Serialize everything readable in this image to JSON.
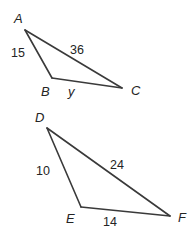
{
  "figure": {
    "stroke_color": "#3a3a3a",
    "text_color": "#242424",
    "background_color": "#ffffff",
    "triangles": [
      {
        "name": "triangle-abc",
        "vertices": [
          {
            "label": "A",
            "x": 25,
            "y": 30
          },
          {
            "label": "B",
            "x": 52,
            "y": 78
          },
          {
            "label": "C",
            "x": 122,
            "y": 88
          }
        ],
        "vertex_labels": [
          {
            "text": "A",
            "x": 14,
            "y": 12
          },
          {
            "text": "B",
            "x": 41,
            "y": 85
          },
          {
            "text": "C",
            "x": 131,
            "y": 84
          }
        ],
        "side_labels": [
          {
            "text": "15",
            "side": "AB",
            "x": 11,
            "y": 47
          },
          {
            "text": "36",
            "side": "AC",
            "x": 70,
            "y": 44
          },
          {
            "text": "y",
            "side": "BC",
            "x": 68,
            "y": 85
          }
        ]
      },
      {
        "name": "triangle-def",
        "vertices": [
          {
            "label": "D",
            "x": 47,
            "y": 128
          },
          {
            "label": "E",
            "x": 81,
            "y": 207
          },
          {
            "label": "F",
            "x": 170,
            "y": 216
          }
        ],
        "vertex_labels": [
          {
            "text": "D",
            "x": 35,
            "y": 111
          },
          {
            "text": "E",
            "x": 66,
            "y": 212
          },
          {
            "text": "F",
            "x": 178,
            "y": 211
          }
        ],
        "side_labels": [
          {
            "text": "10",
            "side": "DE",
            "x": 36,
            "y": 165
          },
          {
            "text": "24",
            "side": "DF",
            "x": 110,
            "y": 159
          },
          {
            "text": "14",
            "side": "EF",
            "x": 103,
            "y": 216
          }
        ]
      }
    ]
  }
}
